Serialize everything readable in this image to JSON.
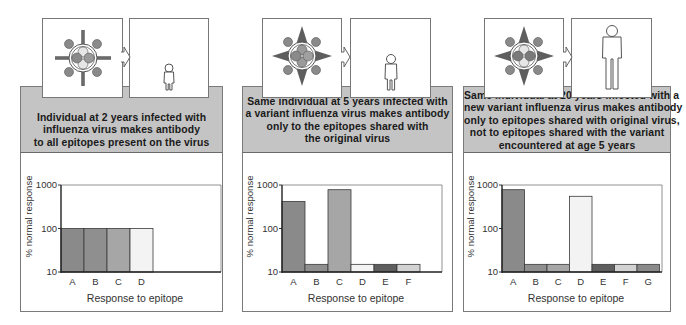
{
  "figure": {
    "panels": [
      {
        "id": "age-2",
        "caption_lines": [
          "Individual at 2 years infected with",
          "influenza virus makes antibody",
          "to all epitopes present on the virus"
        ],
        "virus_icon": "original-virus-icon",
        "person_icon": "child-small-icon"
      },
      {
        "id": "age-5",
        "caption_lines": [
          "Same individual at 5 years infected with",
          "a variant influenza virus makes antibody",
          "only to the epitopes shared with",
          "the original virus"
        ],
        "virus_icon": "variant-virus-icon",
        "person_icon": "child-medium-icon"
      },
      {
        "id": "age-20",
        "caption_lines": [
          "Same individual at 20 years infected with a",
          "new variant influenza virus makes antibody",
          "only to epitopes shared with original virus,",
          "not to epitopes shared with the variant",
          "encountered at age 5 years"
        ],
        "virus_icon": "new-variant-virus-icon",
        "person_icon": "adult-icon"
      }
    ]
  },
  "chart_data": [
    {
      "type": "bar",
      "title": "",
      "xlabel": "Response to epitope",
      "ylabel": "% normal response",
      "yscale": "log",
      "ylim": [
        10,
        1000
      ],
      "yticks": [
        "10",
        "100",
        "1000"
      ],
      "categories": [
        "A",
        "B",
        "C",
        "D"
      ],
      "values": [
        100,
        100,
        100,
        100
      ],
      "bar_colors": [
        "#8a8a8a",
        "#8f8f8f",
        "#a6a6a6",
        "#f3f3f3"
      ],
      "grid": false
    },
    {
      "type": "bar",
      "title": "",
      "xlabel": "Response to epitope",
      "ylabel": "% normal response",
      "yscale": "log",
      "ylim": [
        10,
        1000
      ],
      "yticks": [
        "10",
        "100",
        "1000"
      ],
      "categories": [
        "A",
        "B",
        "C",
        "D",
        "E",
        "F"
      ],
      "values": [
        420,
        15,
        780,
        15,
        15,
        15
      ],
      "bar_colors": [
        "#8a8a8a",
        "#8f8f8f",
        "#a6a6a6",
        "#f3f3f3",
        "#5e5e5e",
        "#d2d2d2"
      ],
      "grid": false
    },
    {
      "type": "bar",
      "title": "",
      "xlabel": "Response to epitope",
      "ylabel": "% normal response",
      "yscale": "log",
      "ylim": [
        10,
        1000
      ],
      "yticks": [
        "10",
        "100",
        "1000"
      ],
      "categories": [
        "A",
        "B",
        "C",
        "D",
        "E",
        "F",
        "G"
      ],
      "values": [
        780,
        15,
        15,
        550,
        15,
        15,
        15
      ],
      "bar_colors": [
        "#8a8a8a",
        "#8f8f8f",
        "#a6a6a6",
        "#f3f3f3",
        "#5e5e5e",
        "#d2d2d2",
        "#8a8a8a"
      ],
      "grid": false
    }
  ]
}
